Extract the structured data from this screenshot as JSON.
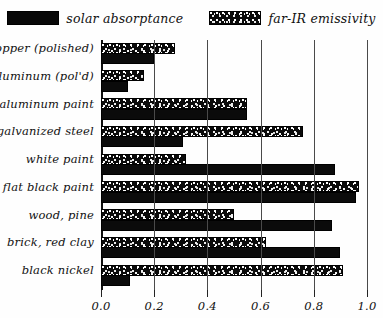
{
  "legend": {
    "entries": [
      {
        "label": "solar absorptance",
        "pattern": "solid",
        "swatch_name": "legend-swatch-solar-absorptance"
      },
      {
        "label": "far-IR emissivity",
        "pattern": "speckle",
        "swatch_name": "legend-swatch-far-ir-emissivity"
      }
    ]
  },
  "axis": {
    "x_ticklabels": [
      "0.0",
      "0.2",
      "0.4",
      "0.6",
      "0.8",
      "1.0"
    ],
    "x_tickvalues": [
      0.0,
      0.2,
      0.4,
      0.6,
      0.8,
      1.0
    ]
  },
  "chart_data": {
    "type": "bar",
    "orientation": "horizontal",
    "title": "",
    "xlabel": "",
    "ylabel": "",
    "xlim": [
      0.0,
      1.0
    ],
    "grid": true,
    "legend_position": "top-center",
    "categories": [
      "copper (polished)",
      "aluminum (pol'd)",
      "aluminum paint",
      "galvanized steel",
      "white paint",
      "flat black paint",
      "wood, pine",
      "brick, red clay",
      "black nickel"
    ],
    "series": [
      {
        "name": "far-IR emissivity",
        "pattern": "speckle",
        "values": [
          0.28,
          0.16,
          0.55,
          0.76,
          0.32,
          0.97,
          0.5,
          0.62,
          0.91
        ]
      },
      {
        "name": "solar absorptance",
        "pattern": "solid",
        "values": [
          0.2,
          0.1,
          0.55,
          0.31,
          0.88,
          0.96,
          0.87,
          0.9,
          0.11
        ]
      }
    ]
  },
  "colors": {
    "bar_fill": "#0b0b0b",
    "speckle_fill": "#ffffff",
    "grid": "#4a4a4a",
    "axis": "#111111",
    "background": "#fefefe"
  }
}
